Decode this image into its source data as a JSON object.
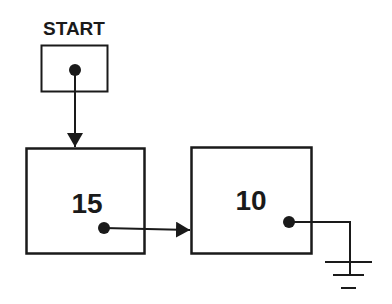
{
  "diagram": {
    "start_label": "START",
    "nodes": [
      {
        "value": "15"
      },
      {
        "value": "10"
      }
    ],
    "colors": {
      "stroke": "#1a1a1a",
      "background": "#ffffff"
    }
  }
}
